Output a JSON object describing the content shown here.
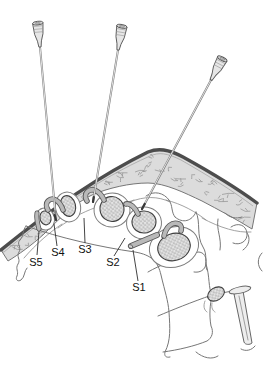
{
  "figure": {
    "labels": [
      {
        "id": "s5",
        "text": "S5"
      },
      {
        "id": "s4",
        "text": "S4"
      },
      {
        "id": "s3",
        "text": "S3"
      },
      {
        "id": "s2",
        "text": "S2"
      },
      {
        "id": "s1",
        "text": "S1"
      }
    ],
    "needle_count": 3
  },
  "colors": {
    "background": "#ffffff",
    "skin_fill": "#dcdcdc",
    "skin_edge": "#4d4d4d",
    "bone_outline": "#777777",
    "nerve_gray": "#b9b9b9",
    "nerve_outline": "#555555",
    "needle_shaft": "#7d7d7d",
    "stipple_dot": "#555555",
    "stipple_bg": "#e4e4e4",
    "label_text": "#111111"
  }
}
